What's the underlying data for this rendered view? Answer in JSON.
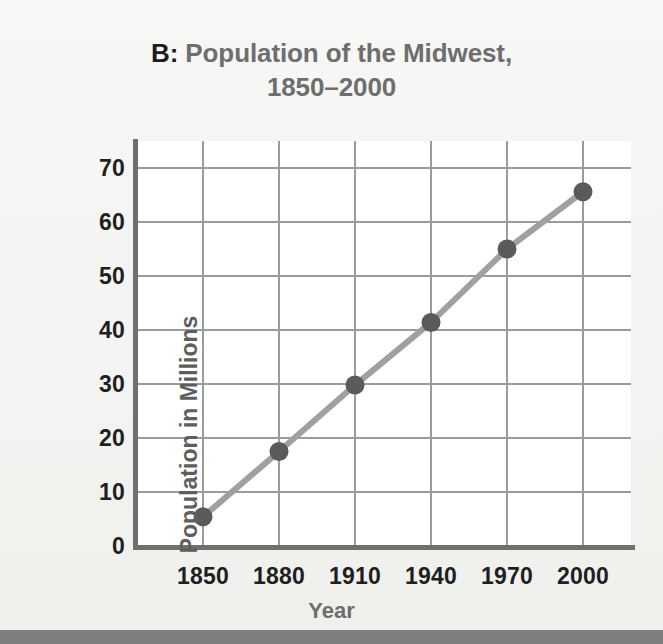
{
  "title": {
    "prefix": "B:",
    "line1": "Population of the Midwest,",
    "line2": "1850–2000"
  },
  "axes": {
    "ylabel": "Population in Millions",
    "xlabel": "Year"
  },
  "colors": {
    "title_prefix": "#1c1c1c",
    "title_text": "#6e6e6e",
    "axis": "#6f6f6f",
    "grid": "#9b9b9b",
    "line": "#a0a0a0",
    "marker": "#5a5a5a",
    "tick_text": "#1f1f1f",
    "axis_label": "#6e6e6e",
    "plot_bg": "#ffffff",
    "page_bg": "#f4f4f2",
    "bottom_band": "#7e7e7e"
  },
  "chart_data": {
    "type": "line",
    "title": "B: Population of the Midwest, 1850–2000",
    "xlabel": "Year",
    "ylabel": "Population in Millions",
    "x": [
      1850,
      1880,
      1910,
      1940,
      1970,
      2000
    ],
    "xticklabels": [
      "1850",
      "1880",
      "1910",
      "1940",
      "1970",
      "2000"
    ],
    "yticks": [
      0,
      10,
      20,
      30,
      40,
      50,
      60,
      70
    ],
    "yticklabels": [
      "0",
      "10",
      "20",
      "30",
      "40",
      "50",
      "60",
      "70"
    ],
    "values": [
      5.4,
      17.5,
      29.8,
      41.4,
      55.0,
      65.6
    ],
    "series": [
      {
        "name": "Midwest population",
        "values": [
          5.4,
          17.5,
          29.8,
          41.4,
          55.0,
          65.6
        ]
      }
    ],
    "ylim": [
      0,
      75
    ],
    "xlim": [
      1840,
      2010
    ],
    "grid": true,
    "legend": "none",
    "markers": "filled-circle"
  }
}
